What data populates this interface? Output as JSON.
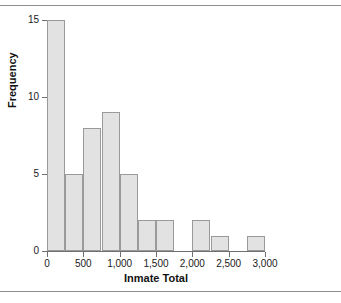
{
  "figure": {
    "has_top_rule": true,
    "has_bottom_rule": true,
    "bar_fill_color": "#e2e2e2",
    "bar_border_color": "#9a9a9a",
    "axis_color": "#6f6f6f"
  },
  "chart_data": {
    "type": "bar",
    "title": "",
    "xlabel": "Inmate Total",
    "ylabel": "Frequency",
    "xlim": [
      0,
      3000
    ],
    "ylim": [
      0,
      15
    ],
    "grid": false,
    "legend": null,
    "bin_width": 250,
    "x_ticks": [
      0,
      500,
      1000,
      1500,
      2000,
      2500,
      3000
    ],
    "x_tick_labels": [
      "0",
      "500",
      "1,000",
      "1,500",
      "2,000",
      "2,500",
      "3,000"
    ],
    "y_ticks": [
      0,
      5,
      10,
      15
    ],
    "y_tick_labels": [
      "0",
      "5",
      "10",
      "15"
    ],
    "bins": [
      {
        "start": 0,
        "end": 250,
        "value": 15
      },
      {
        "start": 250,
        "end": 500,
        "value": 5
      },
      {
        "start": 500,
        "end": 750,
        "value": 8
      },
      {
        "start": 750,
        "end": 1000,
        "value": 9
      },
      {
        "start": 1000,
        "end": 1250,
        "value": 5
      },
      {
        "start": 1250,
        "end": 1500,
        "value": 2
      },
      {
        "start": 1500,
        "end": 1750,
        "value": 2
      },
      {
        "start": 1750,
        "end": 2000,
        "value": 0
      },
      {
        "start": 2000,
        "end": 2250,
        "value": 2
      },
      {
        "start": 2250,
        "end": 2500,
        "value": 1
      },
      {
        "start": 2500,
        "end": 2750,
        "value": 0
      },
      {
        "start": 2750,
        "end": 3000,
        "value": 1
      }
    ],
    "categories": [
      "0-250",
      "250-500",
      "500-750",
      "750-1000",
      "1000-1250",
      "1250-1500",
      "1500-1750",
      "1750-2000",
      "2000-2250",
      "2250-2500",
      "2500-2750",
      "2750-3000"
    ],
    "values": [
      15,
      5,
      8,
      9,
      5,
      2,
      2,
      0,
      2,
      1,
      0,
      1
    ]
  }
}
